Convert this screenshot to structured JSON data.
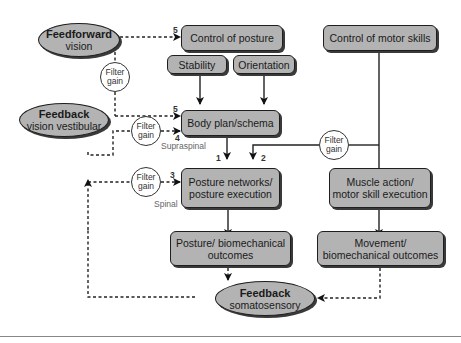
{
  "diagram": {
    "nodes": {
      "feedforward": {
        "title": "Feedforward",
        "subtitle": "vision"
      },
      "feedback_vv": {
        "title": "Feedback",
        "subtitle": "vision vestibular"
      },
      "feedback_soma": {
        "title": "Feedback",
        "subtitle": "somatosensory"
      },
      "control_posture": {
        "label": "Control of posture"
      },
      "stability": {
        "label": "Stability"
      },
      "orientation": {
        "label": "Orientation"
      },
      "control_motor": {
        "label": "Control of motor skills"
      },
      "body_plan": {
        "label": "Body plan/schema"
      },
      "posture_networks": {
        "label": "Posture networks/\nposture execution"
      },
      "muscle_action": {
        "label": "Muscle action/\nmotor skill execution"
      },
      "posture_outcomes": {
        "label": "Posture/ biomechanical\noutcomes"
      },
      "movement_outcomes": {
        "label": "Movement/\nbiomechanical outcomes"
      }
    },
    "filters": [
      {
        "id": "filter-1",
        "line1": "Filter",
        "line2": "gain"
      },
      {
        "id": "filter-2",
        "line1": "Filter",
        "line2": "gain"
      },
      {
        "id": "filter-3",
        "line1": "Filter",
        "line2": "gain"
      },
      {
        "id": "filter-4",
        "line1": "Filter",
        "line2": "gain"
      }
    ],
    "numbers": {
      "n5_top": "5",
      "n5_body": "5",
      "n4": "4",
      "n3": "3",
      "n1": "1",
      "n2": "2"
    },
    "labels": {
      "supraspinal": "Supraspinal",
      "spinal": "Spinal"
    }
  }
}
